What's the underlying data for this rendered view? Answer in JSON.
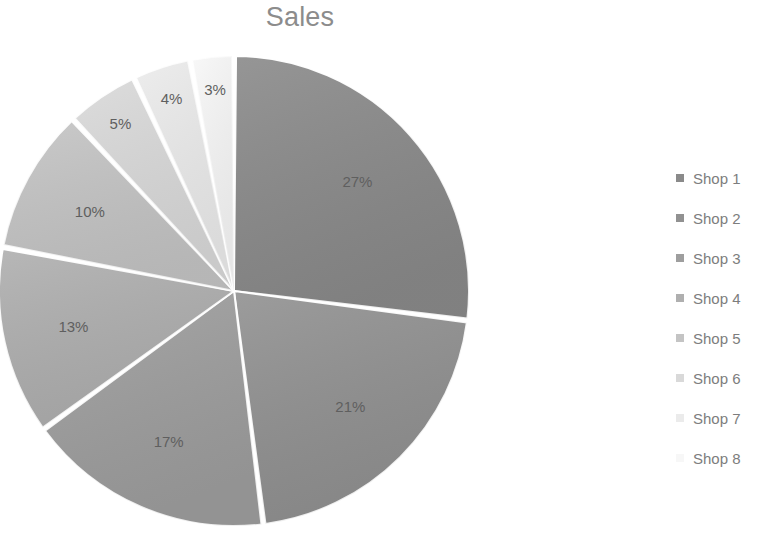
{
  "chart_data": {
    "type": "pie",
    "title": "Sales",
    "categories": [
      "Shop 1",
      "Shop 2",
      "Shop 3",
      "Shop 4",
      "Shop 5",
      "Shop 6",
      "Shop 7",
      "Shop 8"
    ],
    "values": [
      27,
      21,
      17,
      13,
      10,
      5,
      4,
      3
    ],
    "data_labels": [
      "27%",
      "21%",
      "17%",
      "13%",
      "10%",
      "5%",
      "4%",
      "3%"
    ],
    "value_unit": "percent",
    "slice_colors": [
      "#8a8a8a",
      "#919191",
      "#9e9e9e",
      "#afafaf",
      "#c4c4c4",
      "#d9d9d9",
      "#ebebeb",
      "#f7f7f7"
    ],
    "slice_border_color": "#ffffff",
    "start_angle_deg": 0,
    "direction": "clockwise",
    "title_color": "#8c8c8c",
    "label_color": "#5f5f5f",
    "legend_text_color": "#7d7d7d",
    "legend_position": "right",
    "grid": false,
    "xlabel": "",
    "ylabel": ""
  },
  "legend": {
    "items": [
      {
        "label": "Shop 1",
        "color": "#8a8a8a"
      },
      {
        "label": "Shop 2",
        "color": "#919191"
      },
      {
        "label": "Shop 3",
        "color": "#9e9e9e"
      },
      {
        "label": "Shop 4",
        "color": "#afafaf"
      },
      {
        "label": "Shop 5",
        "color": "#c4c4c4"
      },
      {
        "label": "Shop 6",
        "color": "#d9d9d9"
      },
      {
        "label": "Shop 7",
        "color": "#ebebeb"
      },
      {
        "label": "Shop 8",
        "color": "#f7f7f7"
      }
    ]
  }
}
